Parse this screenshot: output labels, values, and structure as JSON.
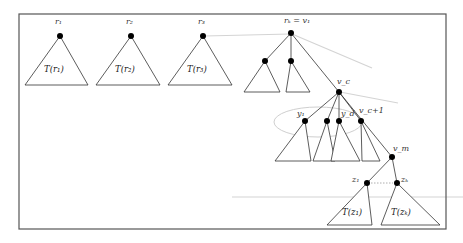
{
  "diagram": {
    "type": "tree-decomposition",
    "roots": [
      {
        "label": "r₁",
        "subtree": "T(r₁)"
      },
      {
        "label": "r₂",
        "subtree": "T(r₂)"
      },
      {
        "label": "r₃",
        "subtree": "T(r₃)"
      }
    ],
    "path_root_label": "rₖ = v₁",
    "vc_label": "v_c",
    "children": {
      "y1": "y₁",
      "yd": "y_d",
      "vc1": "v_c+1"
    },
    "vm_label": "v_m",
    "leaves": [
      {
        "label": "z₁",
        "subtree": "T(z₁)"
      },
      {
        "label": "zₖ",
        "subtree": "T(zₖ)"
      }
    ]
  }
}
